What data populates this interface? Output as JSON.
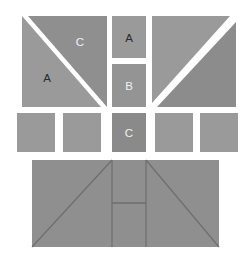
{
  "figure": {
    "canvas": {
      "width": 251,
      "height": 259
    },
    "background_color": "#ffffff",
    "colors": {
      "light_gray": "#9a9a9a",
      "mid_gray": "#949494",
      "dark_gray": "#8a8a8a",
      "darker_gray": "#838383",
      "gap_white": "#ffffff",
      "outline": "#6e6e6e",
      "label_dark": "#2b2b2b",
      "label_light": "#f2f2f2"
    },
    "rows": {
      "top_row": {
        "name": "top-row",
        "left_square": {
          "name": "split-square-left",
          "x": 22,
          "y": 16,
          "width": 85,
          "height": 91,
          "diagonal": "top-left-to-bottom-right",
          "lower_left_triangle": {
            "label": "A",
            "label_color": "dark",
            "fill": "#9a9a9a"
          },
          "upper_right_triangle": {
            "label": "C",
            "label_color": "light",
            "fill": "#8f8f8f"
          }
        },
        "center_square_a": {
          "name": "square-a",
          "label": "A",
          "label_color": "dark",
          "x": 112,
          "y": 16,
          "width": 34,
          "height": 42,
          "fill": "#9a9a9a"
        },
        "center_square_b": {
          "name": "square-b",
          "label": "B",
          "label_color": "light",
          "x": 112,
          "y": 64,
          "width": 34,
          "height": 43,
          "fill": "#949494"
        },
        "right_square": {
          "name": "split-square-right",
          "x": 152,
          "y": 16,
          "width": 84,
          "height": 91,
          "diagonal": "bottom-left-to-top-right",
          "upper_left_triangle": {
            "label": "",
            "fill": "#9a9a9a"
          },
          "lower_right_triangle": {
            "label": "",
            "fill": "#8c8c8c"
          }
        }
      },
      "middle_row": {
        "name": "middle-row",
        "y": 113,
        "height": 39,
        "squares": [
          {
            "name": "tile-1",
            "label": "",
            "x": 17,
            "width": 38,
            "fill": "#9a9a9a",
            "label_color": "dark"
          },
          {
            "name": "tile-2",
            "label": "",
            "x": 63,
            "width": 38,
            "fill": "#9a9a9a",
            "label_color": "dark"
          },
          {
            "name": "tile-3",
            "label": "C",
            "x": 112,
            "width": 34,
            "fill": "#8a8a8a",
            "label_color": "light"
          },
          {
            "name": "tile-4",
            "label": "",
            "x": 155,
            "width": 38,
            "fill": "#9a9a9a",
            "label_color": "dark"
          },
          {
            "name": "tile-5",
            "label": "",
            "x": 200,
            "width": 38,
            "fill": "#9a9a9a",
            "label_color": "dark"
          }
        ]
      },
      "bottom_row": {
        "name": "bottom-assembly",
        "x": 32,
        "y": 160,
        "width": 187,
        "height": 87,
        "fill": "#8f8f8f",
        "center_column": {
          "x": 112,
          "width": 34
        },
        "divider_y": 203,
        "parts": [
          {
            "name": "left-triangle",
            "label": ""
          },
          {
            "name": "center-upper-rect",
            "label": ""
          },
          {
            "name": "center-lower-rect",
            "label": ""
          },
          {
            "name": "right-triangle",
            "label": ""
          }
        ]
      }
    }
  }
}
